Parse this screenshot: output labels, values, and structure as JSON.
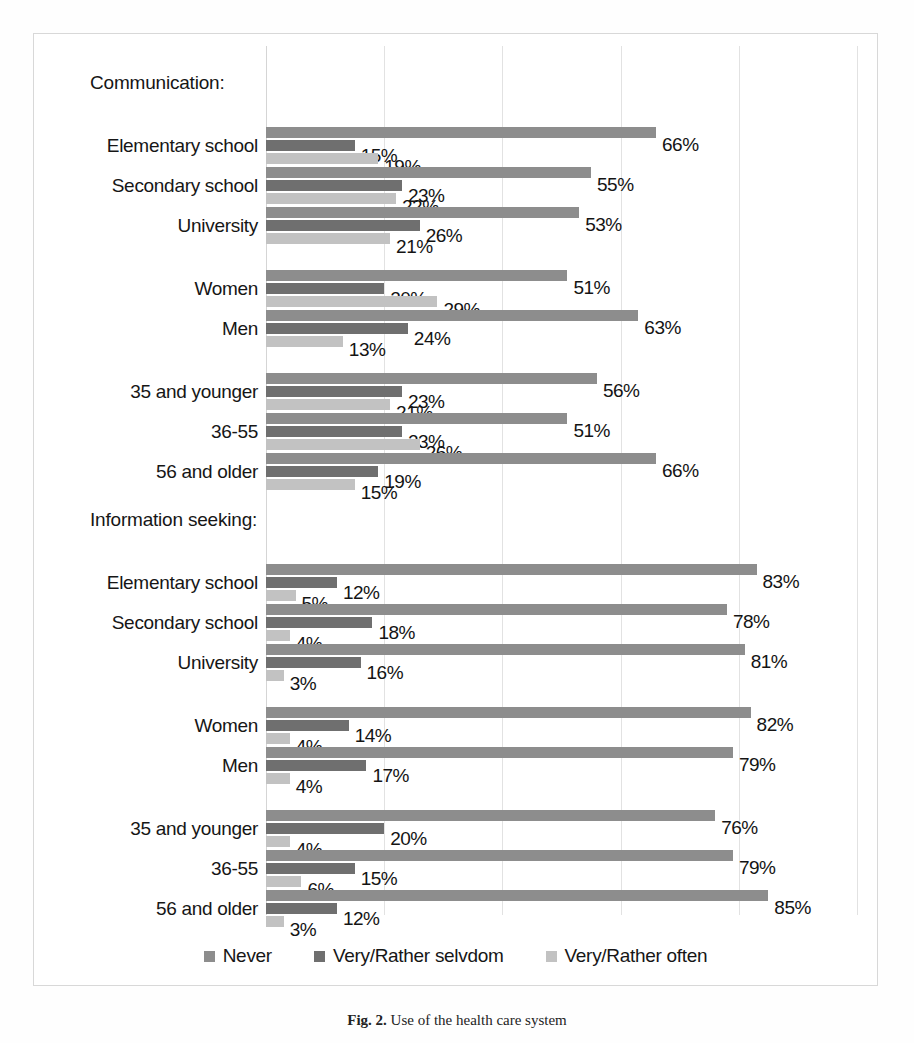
{
  "chart_data": {
    "type": "bar",
    "orientation": "horizontal",
    "grouped": true,
    "title": "",
    "xlabel": "",
    "ylabel": "",
    "xlim": [
      0,
      100
    ],
    "grid": true,
    "gridlines": [
      0,
      20,
      40,
      60,
      80,
      100
    ],
    "value_suffix": "%",
    "legend_position": "bottom",
    "series_names": [
      "Never",
      "Very/Rather selvdom",
      "Very/Rather often"
    ],
    "series_colors": [
      "#8d8d8d",
      "#6f6f6f",
      "#c2c2c2"
    ],
    "sections": [
      {
        "title": "Communication:",
        "categories": [
          "Elementary school",
          "Secondary school",
          "University",
          "Women",
          "Men",
          "35 and younger",
          "36-55",
          "56 and older"
        ],
        "series": [
          {
            "name": "Never",
            "values": [
              66,
              55,
              53,
              51,
              63,
              56,
              51,
              66
            ]
          },
          {
            "name": "Very/Rather selvdom",
            "values": [
              15,
              23,
              26,
              20,
              24,
              23,
              23,
              19
            ]
          },
          {
            "name": "Very/Rather often",
            "values": [
              19,
              22,
              21,
              29,
              13,
              21,
              26,
              15
            ]
          }
        ]
      },
      {
        "title": "Information seeking:",
        "categories": [
          "Elementary school",
          "Secondary school",
          "University",
          "Women",
          "Men",
          "35 and younger",
          "36-55",
          "56 and older"
        ],
        "series": [
          {
            "name": "Never",
            "values": [
              83,
              78,
              81,
              82,
              79,
              76,
              79,
              85
            ]
          },
          {
            "name": "Very/Rather selvdom",
            "values": [
              12,
              18,
              16,
              14,
              17,
              20,
              15,
              12
            ]
          },
          {
            "name": "Very/Rather often",
            "values": [
              5,
              4,
              3,
              4,
              4,
              4,
              6,
              3
            ]
          }
        ]
      }
    ]
  },
  "legend": [
    {
      "label": "Never",
      "color": "#8d8d8d"
    },
    {
      "label": "Very/Rather selvdom",
      "color": "#6f6f6f"
    },
    {
      "label": "Very/Rather often",
      "color": "#c2c2c2"
    }
  ],
  "caption": {
    "figure_number": "Fig. 2.",
    "text": "Use of the health care system"
  }
}
